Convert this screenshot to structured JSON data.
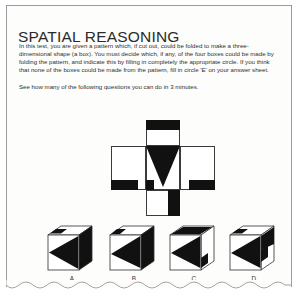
{
  "page": {
    "title": "SPATIAL REASONING",
    "paragraphs": [
      "In this test,  you are given a pattern which, if cut out, could be folded to make a three-dimensional shape (a box). You must decide which, if any, of the four boxes could be made by folding the pattern, and indicate this by filling in completely the appropriate circle. If you think that none of the boxes could be made from the pattern, fill in circle 'E' on your answer sheet.",
      "See how many of the following questions you can do in 3 minutes."
    ],
    "colors": {
      "ink": "#111111",
      "text": "#2e2e2e",
      "paper": "#fdfdfb",
      "border": "#9a9a96",
      "outline": "#3b3b3b"
    }
  },
  "pattern": {
    "name": "cube-net-cross",
    "description": "Unfolded cube pattern: horizontal row of three squares with one square above and one below the centre square. Centre square holds a large black downward-pointing triangle; the square above carries a black horizontal band across its top; black bars sit at the lower edges of the side squares and a black bar runs down the lower square.",
    "faces": [
      {
        "id": "top-face",
        "label": "top"
      },
      {
        "id": "left-face",
        "label": "left"
      },
      {
        "id": "centre-face",
        "label": "centre"
      },
      {
        "id": "right-face",
        "label": "right"
      },
      {
        "id": "bottom-face",
        "label": "bottom"
      }
    ]
  },
  "answers": {
    "options": [
      {
        "id": "A",
        "label": "A",
        "name": "answer-option-a"
      },
      {
        "id": "B",
        "label": "B",
        "name": "answer-option-b"
      },
      {
        "id": "C",
        "label": "C",
        "name": "answer-option-c"
      },
      {
        "id": "D",
        "label": "D",
        "name": "answer-option-d"
      }
    ]
  }
}
